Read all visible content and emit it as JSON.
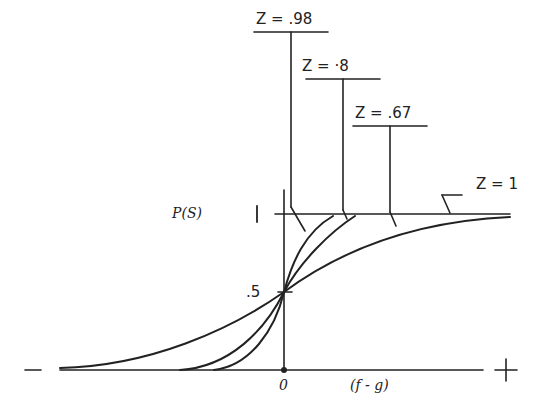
{
  "diagram": {
    "type": "sigmoid-family",
    "y_axis_label": "P(S)",
    "y_tick_top": "1",
    "y_tick_mid": ".5",
    "x_origin_label": "0",
    "x_axis_label": "(f - g)",
    "x_neg_label": "−",
    "x_pos_label": "+",
    "curves": [
      {
        "name": "z-0.98",
        "label": "Z = .98"
      },
      {
        "name": "z-0.8",
        "label": "Z = ·8"
      },
      {
        "name": "z-0.67",
        "label": "Z = .67"
      },
      {
        "name": "z-1",
        "label": "Z = 1"
      }
    ]
  }
}
